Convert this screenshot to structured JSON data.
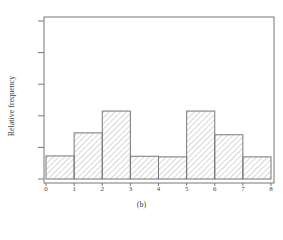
{
  "chart_data": {
    "type": "bar",
    "subtype": "histogram",
    "title": "",
    "caption": "(b)",
    "xlabel": "",
    "ylabel": "Relative frequency",
    "bin_edges": [
      0,
      1,
      2,
      3,
      4,
      5,
      6,
      7,
      8
    ],
    "categories": [
      "0-1",
      "1-2",
      "2-3",
      "3-4",
      "4-5",
      "5-6",
      "6-7",
      "7-8"
    ],
    "values": [
      0.73,
      1.46,
      2.15,
      0.72,
      0.7,
      2.15,
      1.4,
      0.7
    ],
    "values_unit": "y-tick intervals (y-axis unlabeled)",
    "xticks": [
      "0",
      "1",
      "2",
      "3",
      "4",
      "5",
      "6",
      "7",
      "8"
    ],
    "yticks_count": 6,
    "yticks_labeled": false,
    "xlim": [
      0,
      8
    ],
    "ylim": [
      0,
      5
    ],
    "grid": false,
    "legend": null,
    "fill": "diagonal hatch",
    "colors": {
      "edge": "#777777",
      "hatch": "#999999",
      "frame": "#777777"
    }
  }
}
